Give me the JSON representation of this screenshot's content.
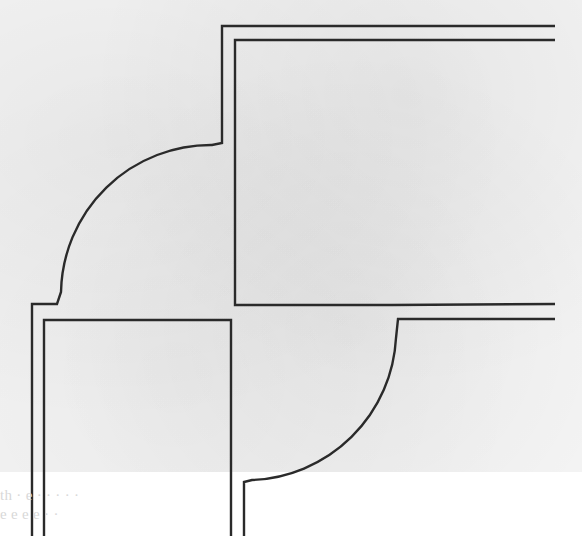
{
  "figure": {
    "type": "plan-view line drawing",
    "stroke_color": "#2a2a2a",
    "background_color": "#f4f4f4"
  },
  "shapes": {
    "upper_right_block": "rectangle with double outline",
    "lower_left_block": "rectangle with double outline",
    "upper_left_fillet": "quarter arc",
    "lower_right_fillet": "quarter arc"
  },
  "caption_ghost": {
    "line1": "th                         ·   e            ·    ·  ·                  ·  · ",
    "line2": "e        e    e            e                        · ·                  "
  }
}
